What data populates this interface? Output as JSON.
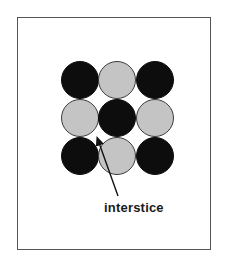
{
  "diagram": {
    "label": "interstice",
    "colors": {
      "dark": "#0d0d0d",
      "light": "#c4c4c4",
      "light_stroke": "#3a3a3a",
      "arrow": "#111111"
    },
    "grid": [
      [
        "dark",
        "light",
        "dark"
      ],
      [
        "light",
        "dark",
        "light"
      ],
      [
        "dark",
        "light",
        "dark"
      ]
    ]
  }
}
